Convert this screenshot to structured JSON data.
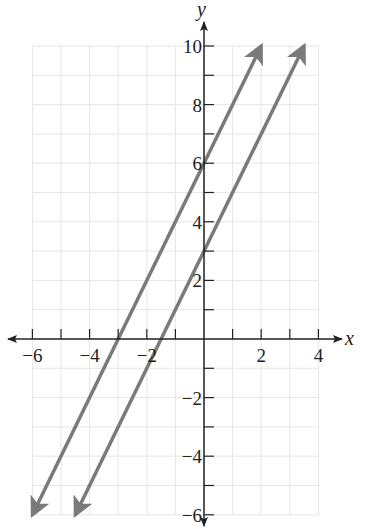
{
  "chart_data": {
    "type": "line",
    "title": "",
    "xlabel": "x",
    "ylabel": "y",
    "xlim": [
      -6,
      4
    ],
    "ylim": [
      -6,
      10
    ],
    "grid": true,
    "x_ticks": [
      -6,
      -5,
      -4,
      -3,
      -2,
      -1,
      1,
      2,
      3,
      4
    ],
    "x_tick_labels": [
      "−6",
      "−4",
      "−2",
      "2",
      "4"
    ],
    "x_tick_label_values": [
      -6,
      -4,
      -2,
      2,
      4
    ],
    "y_ticks": [
      -6,
      -5,
      -4,
      -3,
      -2,
      -1,
      1,
      2,
      3,
      4,
      5,
      6,
      7,
      8,
      9,
      10
    ],
    "y_tick_labels": [
      "10",
      "8",
      "6",
      "4",
      "2",
      "−2",
      "−4",
      "−6"
    ],
    "y_tick_label_values": [
      10,
      8,
      6,
      4,
      2,
      -2,
      -4,
      -6
    ],
    "series": [
      {
        "name": "y = 2x + 6",
        "slope": 2,
        "intercept": 6,
        "x": [
          -6,
          2
        ],
        "y": [
          -6,
          10
        ],
        "color": "#7a7a7a",
        "arrows": "both"
      },
      {
        "name": "y = 2x + 3",
        "slope": 2,
        "intercept": 3,
        "x": [
          -4.5,
          3.5
        ],
        "y": [
          -6,
          10
        ],
        "color": "#7a7a7a",
        "arrows": "both"
      }
    ],
    "legend": null
  },
  "colors": {
    "axis": "#222222",
    "grid": "#e6e6e6",
    "line": "#7a7a7a"
  }
}
